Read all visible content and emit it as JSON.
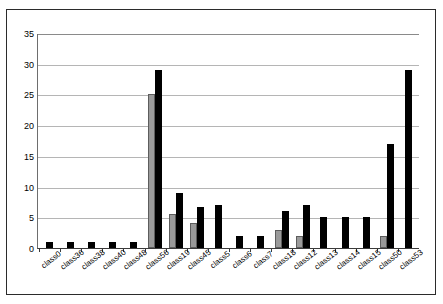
{
  "chart_data": {
    "type": "bar",
    "title": "",
    "subtitle": "",
    "xlabel": "",
    "ylabel": "",
    "ylim": [
      0,
      35
    ],
    "ytick_step": 5,
    "yticks": [
      "35",
      "30",
      "25",
      "20",
      "15",
      "10",
      "5",
      "0"
    ],
    "grid": true,
    "legend": "none",
    "orientation": "vertical",
    "categories": [
      "class0",
      "class36",
      "class38",
      "class40",
      "class48",
      "class56",
      "class19",
      "class45",
      "class5",
      "class6",
      "class7",
      "class18",
      "class12",
      "class13",
      "class14",
      "class15",
      "class50",
      "class53"
    ],
    "series": [
      {
        "name": "series-a",
        "color": "#9a9a9a",
        "values": [
          0,
          0,
          0,
          0,
          0,
          25,
          5.5,
          4,
          0,
          0,
          0,
          3,
          2,
          0,
          0,
          0,
          2,
          0
        ]
      },
      {
        "name": "series-b",
        "color": "#000000",
        "values": [
          1,
          1,
          1,
          1,
          1,
          29,
          9,
          6.7,
          7,
          2,
          2,
          6,
          7,
          5,
          5,
          5,
          17,
          29
        ]
      }
    ]
  },
  "axis": {
    "y_max_label": "35",
    "y_min_label": "0"
  }
}
